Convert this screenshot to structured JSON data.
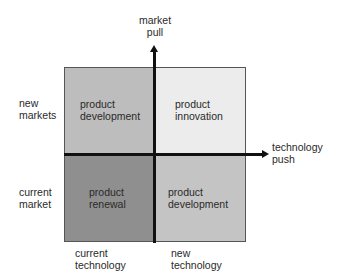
{
  "diagram": {
    "axes": {
      "vertical": {
        "label_line1": "market",
        "label_line2": "pull"
      },
      "horizontal": {
        "label_line1": "technology",
        "label_line2": "push"
      }
    },
    "row_labels": [
      {
        "line1": "new",
        "line2": "markets"
      },
      {
        "line1": "current",
        "line2": "market"
      }
    ],
    "column_labels": [
      {
        "line1": "current",
        "line2": "technology"
      },
      {
        "line1": "new",
        "line2": "technology"
      }
    ],
    "quadrants": {
      "top_left": {
        "line1": "product",
        "line2": "development",
        "color": "#bdbdbd"
      },
      "top_right": {
        "line1": "product",
        "line2": "innovation",
        "color": "#ececec"
      },
      "bottom_left": {
        "line1": "product",
        "line2": "renewal",
        "color": "#8f8f8f"
      },
      "bottom_right": {
        "line1": "product",
        "line2": "development",
        "color": "#c4c4c4"
      }
    }
  }
}
